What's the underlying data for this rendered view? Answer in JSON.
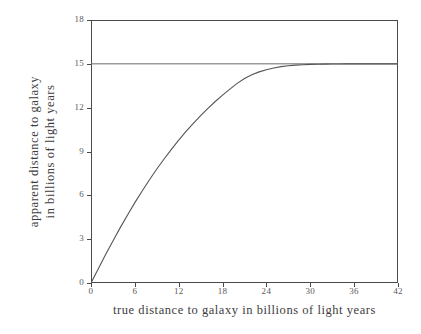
{
  "chart_data": {
    "type": "line",
    "title": "",
    "xlabel": "true distance to galaxy in billions of light years",
    "ylabel_line1": "apparent distance to galaxy",
    "ylabel_line2": "in billions of light years",
    "xlim": [
      0,
      42
    ],
    "ylim": [
      0,
      18
    ],
    "xticks": [
      0,
      6,
      12,
      18,
      24,
      30,
      36,
      42
    ],
    "yticks": [
      0,
      3,
      6,
      9,
      12,
      15,
      18
    ],
    "xticklabels": [
      "0",
      "6",
      "12",
      "18",
      "24",
      "30",
      "36",
      "42"
    ],
    "yticklabels": [
      "0",
      "3",
      "6",
      "9",
      "12",
      "15",
      "18"
    ],
    "grid": false,
    "legend": null,
    "line_color": "#555555",
    "asymptote_color": "#6a6a6a",
    "frame_color": "#4a4a4a",
    "background_color": "#ffffff",
    "series": [
      {
        "name": "apparent distance",
        "type": "line",
        "x": [
          0,
          1,
          2,
          3,
          4,
          5,
          6,
          7,
          8,
          9,
          10,
          11,
          12,
          13,
          14,
          15,
          16,
          17,
          18,
          19,
          20,
          21,
          22,
          23,
          24,
          25,
          26,
          27,
          28,
          29,
          30,
          31,
          32,
          33,
          34,
          35,
          36,
          37,
          38,
          39,
          40,
          41,
          42
        ],
        "y": [
          0.0,
          0.98,
          1.95,
          2.88,
          3.79,
          4.66,
          5.5,
          6.3,
          7.07,
          7.8,
          8.49,
          9.15,
          9.78,
          10.37,
          10.93,
          11.46,
          11.95,
          12.42,
          12.86,
          13.27,
          13.66,
          14.0,
          14.25,
          14.45,
          14.6,
          14.72,
          14.81,
          14.87,
          14.91,
          14.94,
          14.96,
          14.97,
          14.98,
          14.99,
          14.99,
          15.0,
          15.0,
          15.0,
          15.0,
          15.0,
          15.0,
          15.0,
          15.0
        ]
      },
      {
        "name": "asymptote",
        "type": "hline",
        "y_value": 15,
        "x_start": 0,
        "x_end": 42
      }
    ],
    "annotations": []
  }
}
